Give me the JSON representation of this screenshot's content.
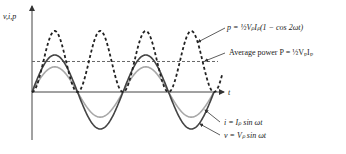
{
  "chart_data": {
    "type": "line",
    "title": "",
    "y_axis_label": "v,i,p",
    "x_axis_label": "t",
    "periods_shown": 2,
    "series": [
      {
        "name": "instantaneous power",
        "label": "p = ½VₚIₚ(1 − cos 2ωt)",
        "style": "dotted",
        "color": "#222222",
        "function": "0.5*Vp*Ip*(1-cos(2wt))"
      },
      {
        "name": "average power",
        "label": "Average power P = ½VₚIₚ",
        "style": "dashed",
        "color": "#555555",
        "function": "0.5*Vp*Ip"
      },
      {
        "name": "current",
        "label": "i = Iₚ sin ωt",
        "style": "solid",
        "color": "#a0a0a0",
        "function": "Ip*sin(wt)"
      },
      {
        "name": "voltage",
        "label": "v = Vₚ sin ωt",
        "style": "solid",
        "color": "#444444",
        "function": "Vp*sin(wt)"
      }
    ],
    "relative_amplitudes": {
      "voltage_peak": 1.0,
      "current_peak": 0.68,
      "power_peak": 1.65,
      "average_power": 0.825
    }
  },
  "labels": {
    "y_axis": "v,i,p",
    "x_axis": "t",
    "power": "p = ½VₚIₚ(1 − cos 2ωt)",
    "average": "Average power P = ½VₚIₚ",
    "current": "i = Iₚ sin ωt",
    "voltage": "v = Vₚ sin ωt"
  }
}
